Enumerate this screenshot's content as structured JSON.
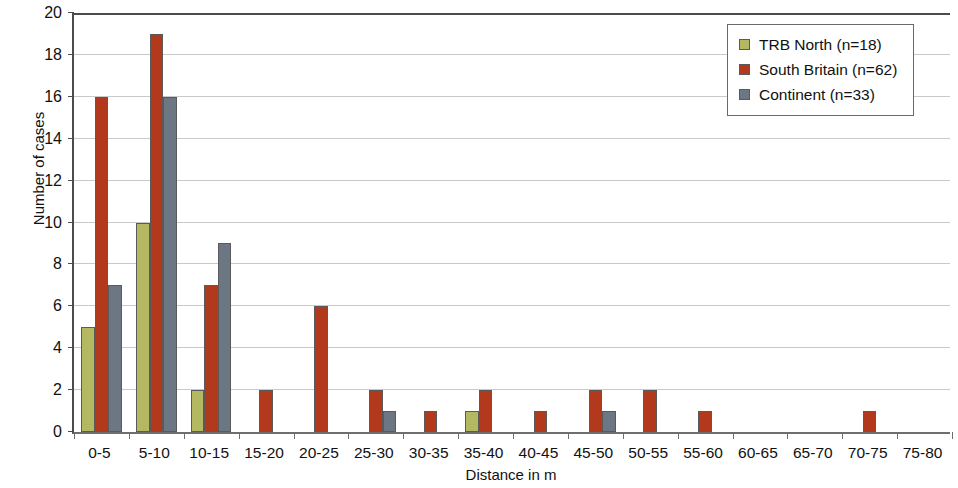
{
  "chart_data": {
    "type": "bar",
    "title": "",
    "xlabel": "Distance in m",
    "ylabel": "Number of cases",
    "categories": [
      "0-5",
      "5-10",
      "10-15",
      "15-20",
      "20-25",
      "25-30",
      "30-35",
      "35-40",
      "40-45",
      "45-50",
      "50-55",
      "55-60",
      "60-65",
      "65-70",
      "70-75",
      "75-80"
    ],
    "series": [
      {
        "name": "TRB North (n=18)",
        "color": "#b4b860",
        "values": [
          5,
          10,
          2,
          0,
          0,
          0,
          0,
          1,
          0,
          0,
          0,
          0,
          0,
          0,
          0,
          0
        ]
      },
      {
        "name": "South Britain (n=62)",
        "color": "#b2391c",
        "values": [
          16,
          19,
          7,
          2,
          6,
          2,
          1,
          2,
          1,
          2,
          2,
          1,
          0,
          0,
          1,
          0
        ]
      },
      {
        "name": "Continent (n=33)",
        "color": "#6d7683",
        "values": [
          7,
          16,
          9,
          0,
          0,
          1,
          0,
          0,
          0,
          1,
          0,
          0,
          0,
          0,
          0,
          0
        ]
      }
    ],
    "ylim": [
      0,
      20
    ],
    "ytick_step": 2,
    "yticks": [
      0,
      2,
      4,
      6,
      8,
      10,
      12,
      14,
      16,
      18,
      20
    ],
    "ytick_labels": [
      "0",
      "2",
      "4",
      "6",
      "8",
      "10",
      "12",
      "14",
      "16",
      "18",
      "20"
    ],
    "grid": true,
    "grid_axis": "y",
    "legend_position": "top-right"
  }
}
